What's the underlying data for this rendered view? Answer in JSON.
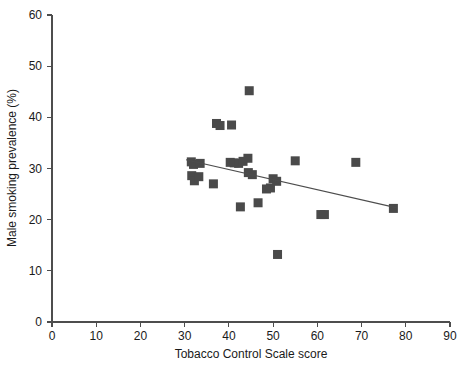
{
  "chart_data": {
    "type": "scatter",
    "title": "",
    "xlabel": "Tobacco Control Scale score",
    "ylabel": "Male smoking prevalence (%)",
    "xlim": [
      0,
      90
    ],
    "ylim": [
      0,
      60
    ],
    "xticks": [
      0,
      10,
      20,
      30,
      40,
      50,
      60,
      70,
      80,
      90
    ],
    "yticks": [
      0,
      10,
      20,
      30,
      40,
      50,
      60
    ],
    "xticklabels": [
      "0",
      "10",
      "20",
      "30",
      "40",
      "50",
      "60",
      "70",
      "80",
      "90"
    ],
    "yticklabels": [
      "0",
      "10",
      "20",
      "30",
      "40",
      "50",
      "60"
    ],
    "grid": false,
    "legend": null,
    "marker": {
      "shape": "square",
      "size_px": 9,
      "color": "#4a4a4a"
    },
    "points": [
      {
        "x": 31.5,
        "y": 31.3
      },
      {
        "x": 32.0,
        "y": 30.8
      },
      {
        "x": 33.5,
        "y": 31.0
      },
      {
        "x": 31.6,
        "y": 28.6
      },
      {
        "x": 32.2,
        "y": 27.6
      },
      {
        "x": 33.2,
        "y": 28.4
      },
      {
        "x": 36.5,
        "y": 27.0
      },
      {
        "x": 37.2,
        "y": 38.8
      },
      {
        "x": 38.0,
        "y": 38.4
      },
      {
        "x": 40.6,
        "y": 38.5
      },
      {
        "x": 40.3,
        "y": 31.2
      },
      {
        "x": 41.2,
        "y": 31.1
      },
      {
        "x": 42.2,
        "y": 31.0
      },
      {
        "x": 43.2,
        "y": 31.4
      },
      {
        "x": 44.3,
        "y": 32.0
      },
      {
        "x": 44.6,
        "y": 45.2
      },
      {
        "x": 42.6,
        "y": 22.5
      },
      {
        "x": 45.3,
        "y": 28.8
      },
      {
        "x": 44.4,
        "y": 29.2
      },
      {
        "x": 46.6,
        "y": 23.3
      },
      {
        "x": 48.5,
        "y": 26.0
      },
      {
        "x": 49.4,
        "y": 26.2
      },
      {
        "x": 50.0,
        "y": 28.0
      },
      {
        "x": 50.8,
        "y": 27.5
      },
      {
        "x": 51.0,
        "y": 13.2
      },
      {
        "x": 55.0,
        "y": 31.5
      },
      {
        "x": 60.8,
        "y": 21.0
      },
      {
        "x": 61.6,
        "y": 21.0
      },
      {
        "x": 68.7,
        "y": 31.2
      },
      {
        "x": 77.2,
        "y": 22.2
      }
    ],
    "trend_line": {
      "x_start": 30.3,
      "y_start": 31.7,
      "x_end": 78.0,
      "y_end": 22.3,
      "color": "#4d4d4d"
    }
  }
}
